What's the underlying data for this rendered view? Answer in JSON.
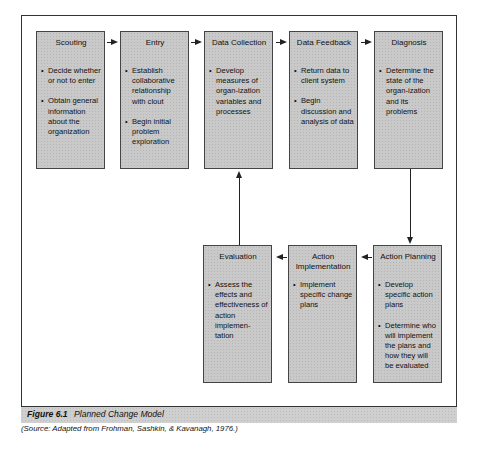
{
  "diagram": {
    "top_row": [
      {
        "title": "Scouting",
        "bullets": [
          "Decide whether or not to enter",
          "Obtain general information about the organization"
        ]
      },
      {
        "title": "Entry",
        "bullets": [
          "Establish collaborative relationship with clout",
          "Begin initial problem exploration"
        ]
      },
      {
        "title": "Data Collection",
        "bullets": [
          "Develop measures of organ-ization variables and processes"
        ]
      },
      {
        "title": "Data Feedback",
        "bullets": [
          "Return data to client system",
          "Begin discussion and analysis of data"
        ]
      },
      {
        "title": "Diagnosis",
        "bullets": [
          "Determine the state of the organ-ization and its problems"
        ]
      }
    ],
    "bottom_row": [
      {
        "title": "Evaluation",
        "bullets": [
          "Assess the effects and effectiveness of action implemen-tation"
        ]
      },
      {
        "title": "Action Implementation",
        "bullets": [
          "Implement specific change plans"
        ]
      },
      {
        "title": "Action Planning",
        "bullets": [
          "Develop specific action plans",
          "Determine who will implement the plans and how they will be evaluated"
        ]
      }
    ],
    "flow": [
      "Scouting",
      "Entry",
      "Data Collection",
      "Data Feedback",
      "Diagnosis",
      "Action Planning",
      "Action Implementation",
      "Evaluation",
      "Data Collection"
    ]
  },
  "caption": {
    "figure_label": "Figure 6.1",
    "figure_title": "Planned Change Model",
    "source": "(Source: Adapted from Frohman, Sashkin, & Kavanagh, 1976.)"
  }
}
